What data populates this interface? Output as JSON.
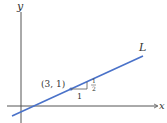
{
  "diagram": {
    "axes": {
      "x_label": "x",
      "y_label": "y"
    },
    "line": {
      "label": "L",
      "color": "#4a72c9",
      "slope": "1/2"
    },
    "point": {
      "label": "(3, 1)",
      "x": 3,
      "y": 1
    },
    "slope_triangle": {
      "run_label": "1",
      "rise_label_num": "1",
      "rise_label_den": "2"
    },
    "colors": {
      "axis": "#555555",
      "line": "#4a72c9",
      "text": "#333333"
    }
  }
}
